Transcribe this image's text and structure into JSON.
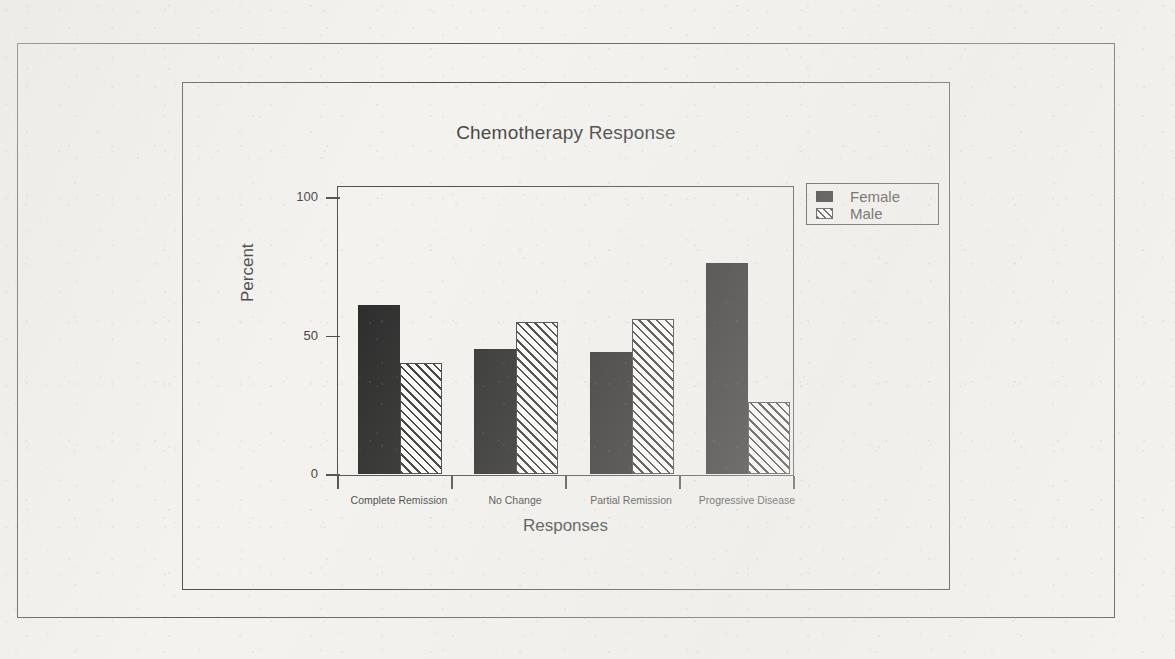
{
  "chart_data": {
    "type": "bar",
    "title": "Chemotherapy Response",
    "xlabel": "Responses",
    "ylabel": "Percent",
    "categories": [
      "Complete Remission",
      "No Change",
      "Partial Remission",
      "Progressive Disease"
    ],
    "series": [
      {
        "name": "Female",
        "values": [
          61,
          45,
          44,
          76
        ],
        "fill": "solid-black",
        "color": "#131313"
      },
      {
        "name": "Male",
        "values": [
          40,
          55,
          56,
          26
        ],
        "fill": "diagonal-hatch",
        "color": "#ffffff"
      }
    ],
    "ylim": [
      0,
      100
    ],
    "yticks": [
      "0",
      "50",
      "100"
    ],
    "ytick_values": [
      0,
      50,
      100
    ],
    "grid": false,
    "legend_position": "top-right-outside",
    "legend_entries": [
      "Female",
      "Male"
    ],
    "bar_mode": "grouped"
  },
  "legend": {
    "items": [
      {
        "label": "Female"
      },
      {
        "label": "Male"
      }
    ]
  },
  "axes": {
    "y_title": "Percent",
    "x_title": "Responses"
  }
}
